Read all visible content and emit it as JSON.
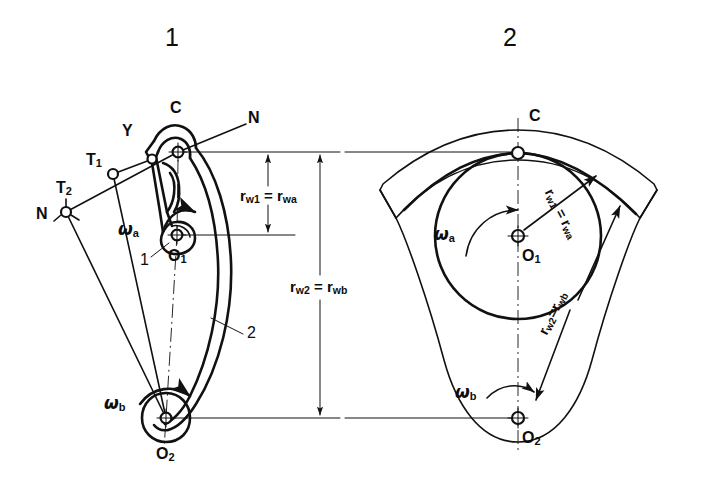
{
  "figure": {
    "type": "engineering-diagram",
    "panels": [
      {
        "id": "panel-1",
        "title": "1",
        "labels": {
          "contact_point": "C",
          "normal_upper": "N",
          "normal_lower": "N",
          "point_y": "Y",
          "tangent_1": "T",
          "tangent_1_sub": "1",
          "tangent_2": "T",
          "tangent_2_sub": "2",
          "omega_a": "ω",
          "omega_a_sub": "a",
          "omega_b": "ω",
          "omega_b_sub": "b",
          "center_1": "O",
          "center_1_sub": "1",
          "center_2": "O",
          "center_2_sub": "2",
          "part_1": "1",
          "part_2": "2"
        },
        "dimensions": [
          {
            "id": "dim-rw1",
            "text_a": "r",
            "sub_a": "w1",
            "eq": " = ",
            "text_b": "r",
            "sub_b": "wa"
          },
          {
            "id": "dim-rw2",
            "text_a": "r",
            "sub_a": "w2",
            "eq": " = ",
            "text_b": "r",
            "sub_b": "wb"
          }
        ]
      },
      {
        "id": "panel-2",
        "title": "2",
        "labels": {
          "contact_point": "C",
          "omega_a": "ω",
          "omega_a_sub": "a",
          "omega_b": "ω",
          "omega_b_sub": "b",
          "center_1": "O",
          "center_1_sub": "1",
          "center_2": "O",
          "center_2_sub": "2"
        },
        "dimensions": [
          {
            "id": "dim-rw1-r",
            "text_a": "r",
            "sub_a": "w1",
            "eq": " = ",
            "text_b": "r",
            "sub_b": "wa"
          },
          {
            "id": "dim-rw2-r",
            "text_a": "r",
            "sub_a": "w2",
            "eq": "=",
            "text_b": "r",
            "sub_b": "wb"
          }
        ]
      }
    ],
    "colors": {
      "ink": "#111111",
      "background": "#ffffff"
    }
  }
}
